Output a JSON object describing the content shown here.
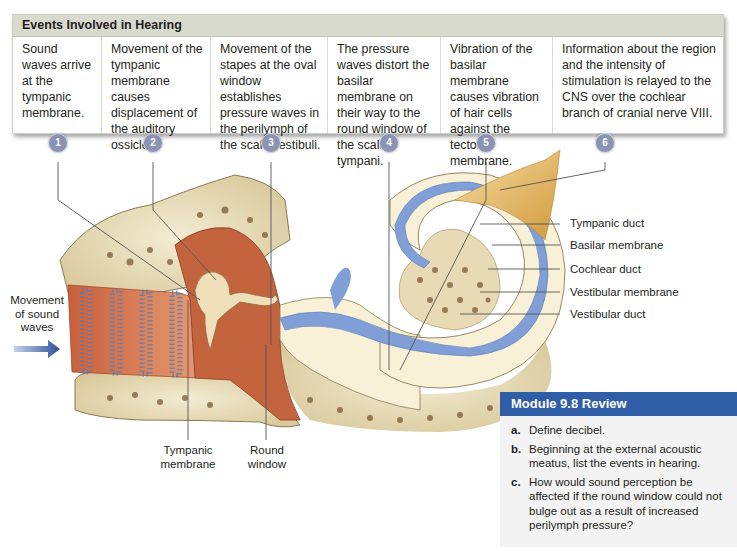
{
  "events_table": {
    "title": "Events Involved in Hearing",
    "steps": [
      {
        "number": "1",
        "text": "Sound waves arrive at the tympanic membrane."
      },
      {
        "number": "2",
        "text": "Movement of the tympanic membrane causes displacement of the auditory ossicles."
      },
      {
        "number": "3",
        "text": "Movement of the stapes at the oval window establishes pressure waves in the perilymph of the scala vestibuli."
      },
      {
        "number": "4",
        "text": "The pressure waves distort the basilar membrane on their way to the round window of the scala tympani."
      },
      {
        "number": "5",
        "text": "Vibration of the basilar membrane causes vibration of hair cells against the tectorial membrane."
      },
      {
        "number": "6",
        "text": "Information about the region and the intensity of stimulation is relayed to the CNS over the cochlear branch of cranial nerve VIII."
      }
    ]
  },
  "diagram": {
    "labels": {
      "movement_of_sound_waves": "Movement of sound waves",
      "tympanic_membrane": "Tympanic membrane",
      "round_window": "Round window",
      "tympanic_duct": "Tympanic duct",
      "basilar_membrane": "Basilar membrane",
      "cochlear_duct": "Cochlear duct",
      "vestibular_membrane": "Vestibular membrane",
      "vestibular_duct": "Vestibular duct"
    },
    "colors": {
      "badge": "#8b93b3",
      "bone": "#efe6c8",
      "canal": "#d9805a",
      "middle_ear": "#c4643e",
      "perilymph_blue": "#7f9fd6",
      "cochlea_fill": "#f8f1d8",
      "nerve": "#e2b766"
    }
  },
  "review": {
    "title": "Module 9.8 Review",
    "items": [
      {
        "letter": "a.",
        "text": "Define decibel."
      },
      {
        "letter": "b.",
        "text": "Beginning at the external acoustic meatus, list the events in hearing."
      },
      {
        "letter": "c.",
        "text": "How would sound perception be affected if the round window could not bulge out as a result of increased perilymph pressure?"
      }
    ]
  }
}
